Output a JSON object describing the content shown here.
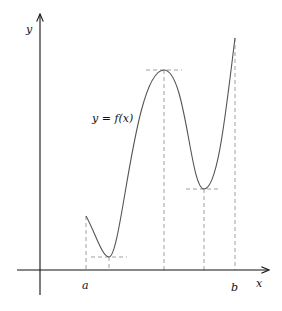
{
  "diagram": {
    "labels": {
      "y_axis": "y",
      "x_axis": "x",
      "function": "y = f(x)",
      "a": "a",
      "b": "b"
    },
    "colors": {
      "axis": "#111111",
      "curve": "#555555",
      "dashed": "#888888"
    },
    "key_points": [
      {
        "name": "start-a",
        "x": 86,
        "y": 216
      },
      {
        "name": "local-min-1",
        "x": 109,
        "y": 257
      },
      {
        "name": "local-max",
        "x": 164,
        "y": 70
      },
      {
        "name": "local-min-2",
        "x": 204,
        "y": 189
      },
      {
        "name": "end-b",
        "x": 235,
        "y": 38
      }
    ]
  }
}
